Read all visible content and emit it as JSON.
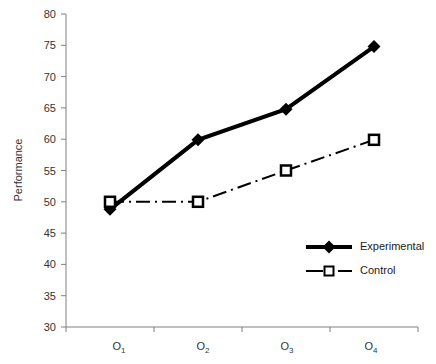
{
  "chart_data": {
    "type": "line",
    "title": "",
    "xlabel": "",
    "ylabel": "Performance",
    "categories": [
      "O1",
      "O2",
      "O3",
      "O4"
    ],
    "category_labels": [
      {
        "base": "O",
        "sub": "1"
      },
      {
        "base": "O",
        "sub": "2"
      },
      {
        "base": "O",
        "sub": "3"
      },
      {
        "base": "O",
        "sub": "4"
      }
    ],
    "ylim": [
      30,
      80
    ],
    "yticks": [
      30,
      35,
      40,
      45,
      50,
      55,
      60,
      65,
      70,
      75,
      80
    ],
    "ytick_labels": [
      "30",
      "35",
      "40",
      "45",
      "50",
      "55",
      "60",
      "65",
      "70",
      "75",
      "80"
    ],
    "grid": false,
    "legend_position": "lower-right",
    "series": [
      {
        "name": "Experimental",
        "values": [
          48.8,
          59.9,
          64.8,
          74.8
        ],
        "color": "#000000",
        "line_style": "solid",
        "line_width": 4,
        "marker": "filled-diamond"
      },
      {
        "name": "Control",
        "values": [
          50.0,
          50.0,
          55.0,
          59.9
        ],
        "color": "#000000",
        "line_style": "dash-dot",
        "line_width": 2,
        "marker": "open-square"
      }
    ]
  },
  "legend": {
    "entries": [
      {
        "label": "Experimental"
      },
      {
        "label": "Control"
      }
    ]
  },
  "axes": {
    "y_title": "Performance"
  }
}
